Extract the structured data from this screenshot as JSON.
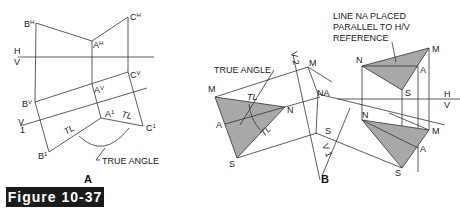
{
  "figure": {
    "label": "Figure 10-37",
    "panels": [
      {
        "id": "A",
        "caption": "A",
        "points": {
          "BH": "B",
          "AH": "A",
          "CH": "C",
          "BV": "B",
          "AV": "A",
          "CV": "C",
          "A1": "A",
          "B1": "B",
          "C1": "C"
        },
        "superscripts": {
          "H": "H",
          "V": "V",
          "one": "1"
        },
        "ref_lines": {
          "hv_top": "H",
          "hv_bottom": "V",
          "v1_top": "V",
          "v1_bottom": "1"
        },
        "tl_labels": [
          "TL",
          "TL"
        ],
        "annotation": "TRUE ANGLE"
      },
      {
        "id": "B",
        "caption": "B",
        "left_points": {
          "M": "M",
          "A": "A",
          "N": "N",
          "S": "S"
        },
        "middle_points": {
          "M": "M",
          "NA": "NA",
          "S": "S"
        },
        "right_top_points": {
          "N": "N",
          "M": "M",
          "A": "A",
          "S": "S"
        },
        "right_bottom_points": {
          "N": "N",
          "M": "M",
          "A": "A",
          "S": "S"
        },
        "ref_lines": {
          "hv_top": "H",
          "hv_bottom": "V",
          "v2_a": "V",
          "v2_b": "2",
          "v1_a": "V",
          "v1_b": "1"
        },
        "tl_labels": [
          "TL",
          "TL"
        ],
        "annotation_angle": "TRUE ANGLE",
        "annotation_line": [
          "LINE NA PLACED",
          "PARALLEL TO H/V",
          "REFERENCE"
        ]
      }
    ]
  }
}
